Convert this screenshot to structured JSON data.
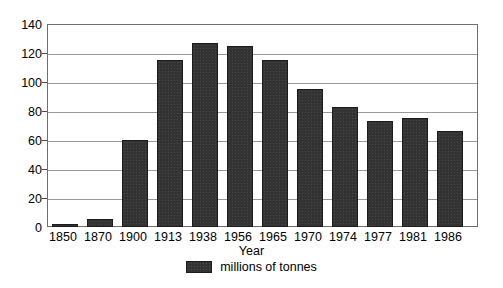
{
  "chart_data": {
    "type": "bar",
    "title": "",
    "subtitle": "",
    "xlabel": "Year",
    "ylabel": "",
    "categories": [
      "1850",
      "1870",
      "1900",
      "1913",
      "1938",
      "1956",
      "1965",
      "1970",
      "1974",
      "1977",
      "1981",
      "1986"
    ],
    "values": [
      2,
      5.5,
      60,
      115,
      127,
      125,
      115,
      95,
      83,
      73,
      75,
      66
    ],
    "series": [
      {
        "name": "millions of tonnes",
        "values": [
          2,
          5.5,
          60,
          115,
          127,
          125,
          115,
          95,
          83,
          73,
          75,
          66
        ]
      }
    ],
    "ylim": [
      0,
      140
    ],
    "y_ticks": [
      0,
      20,
      40,
      60,
      80,
      100,
      120,
      140
    ],
    "y_tick_labels": [
      "0",
      "20",
      "40",
      "60",
      "80",
      "100",
      "120",
      "140"
    ],
    "grid": true,
    "legend": {
      "position": "bottom-center",
      "entries": [
        {
          "label": "millions of tonnes",
          "swatch": "legend-swatch",
          "color": "#333333"
        }
      ]
    },
    "colors": {
      "bar_fill": "#333333",
      "bar_edge": "#1c1c1c",
      "gridline": "#9a9a9a",
      "axis": "#6e6e6e",
      "text": "#000000",
      "background": "#ffffff"
    }
  }
}
